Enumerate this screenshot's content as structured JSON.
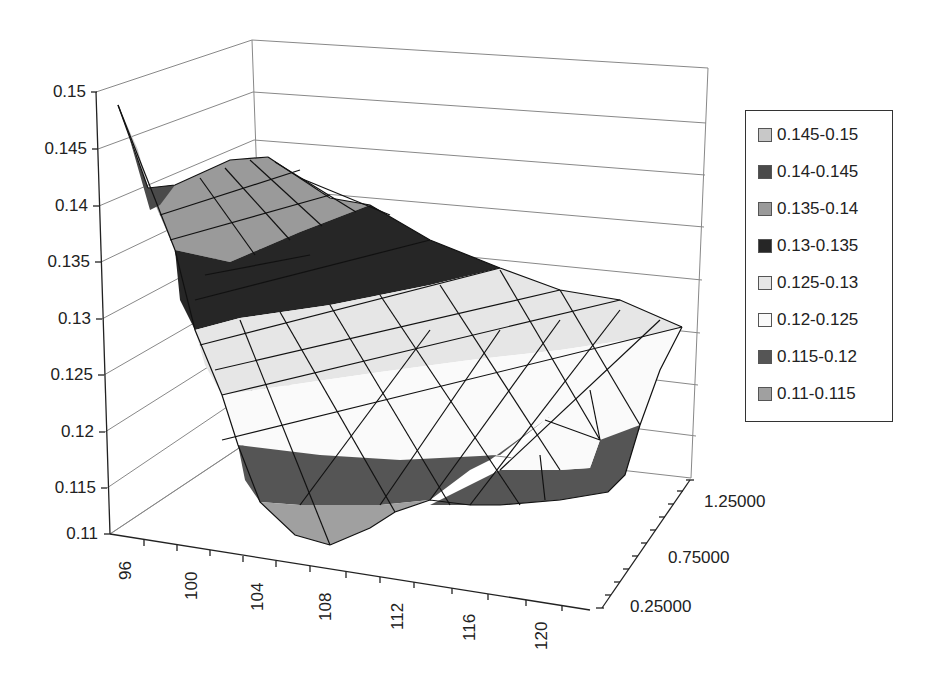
{
  "chart_data": {
    "type": "surface",
    "title": "",
    "xlabel": "",
    "ylabel": "",
    "zlabel": "",
    "x_ticks": [
      "96",
      "100",
      "104",
      "108",
      "112",
      "116",
      "120"
    ],
    "y_ticks": [
      "0.11",
      "0.115",
      "0.12",
      "0.125",
      "0.13",
      "0.135",
      "0.14",
      "0.145",
      "0.15"
    ],
    "z_ticks": [
      "0.25000",
      "0.75000",
      "1.25000"
    ],
    "zlim": [
      0.11,
      0.15
    ],
    "x_range": [
      94,
      122
    ],
    "depth_range": [
      0.25,
      1.45
    ],
    "gridlines": true,
    "legend_position": "right",
    "legend": [
      {
        "label": "0.145-0.15",
        "color": "#c8c8c8"
      },
      {
        "label": "0.14-0.145",
        "color": "#4a4a4a"
      },
      {
        "label": "0.135-0.14",
        "color": "#9a9a9a"
      },
      {
        "label": "0.13-0.135",
        "color": "#262626"
      },
      {
        "label": "0.125-0.13",
        "color": "#e6e6e6"
      },
      {
        "label": "0.12-0.125",
        "color": "#fafafa"
      },
      {
        "label": "0.115-0.12",
        "color": "#555555"
      },
      {
        "label": "0.11-0.115",
        "color": "#a0a0a0"
      }
    ],
    "bands": [
      {
        "range": [
          0.145,
          0.15
        ],
        "color": "#c8c8c8"
      },
      {
        "range": [
          0.14,
          0.145
        ],
        "color": "#4a4a4a"
      },
      {
        "range": [
          0.135,
          0.14
        ],
        "color": "#9a9a9a"
      },
      {
        "range": [
          0.13,
          0.135
        ],
        "color": "#262626"
      },
      {
        "range": [
          0.125,
          0.13
        ],
        "color": "#e6e6e6"
      },
      {
        "range": [
          0.12,
          0.125
        ],
        "color": "#fafafa"
      },
      {
        "range": [
          0.115,
          0.12
        ],
        "color": "#555555"
      },
      {
        "range": [
          0.11,
          0.115
        ],
        "color": "#a0a0a0"
      }
    ],
    "surface_polygons": [
      {
        "band": "0.135-0.14",
        "points": "148,188 175,185 230,160 268,157 330,198 370,205 300,232 230,262 175,250"
      },
      {
        "band": "0.13-0.135",
        "points": "175,250 230,262 300,232 370,205 430,240 500,268 430,285 330,305 240,318 195,330 180,300"
      },
      {
        "band": "0.125-0.13",
        "points": "195,330 240,318 330,305 430,285 500,268 560,290 620,300 682,327 640,338 560,350 470,360 380,372 290,385 222,395 205,365"
      },
      {
        "band": "0.12-0.125",
        "points": "222,395 290,385 380,372 470,360 560,350 640,338 682,327 660,370 640,425 600,440 590,390 545,420 500,455 400,460 320,455 238,445"
      },
      {
        "band": "0.115-0.12",
        "points": "238,445 320,455 400,460 500,455 545,420 490,460 470,470 430,500 380,505 300,505 260,502 245,480"
      },
      {
        "band": "0.115-0.12",
        "points": "600,440 640,425 625,475 608,492 560,500 500,505 470,505 430,505 500,470 560,470 590,468"
      },
      {
        "band": "0.11-0.115",
        "points": "260,502 300,505 380,505 430,500 395,512 370,528 330,545 295,535"
      },
      {
        "band": "0.12-0.125",
        "points": "545,420 590,390 600,440 590,468 560,470 500,470 520,448"
      }
    ]
  }
}
